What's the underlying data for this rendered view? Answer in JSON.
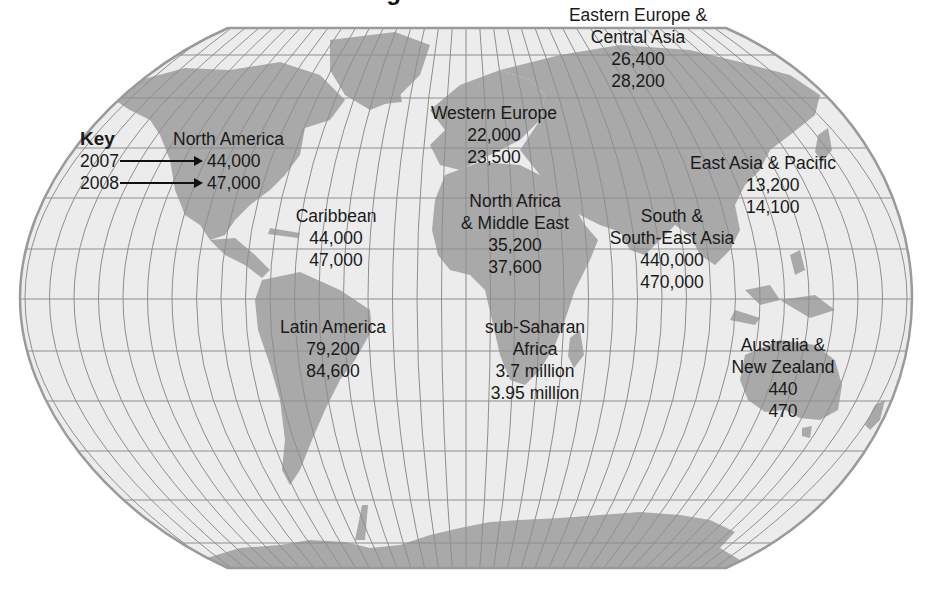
{
  "title": "Regional estimates",
  "colors": {
    "ocean": "#ececec",
    "land": "#a9a9a9",
    "grid": "#8e8e8e",
    "outline": "#9a9a9a",
    "text": "#1a1a1a"
  },
  "key": {
    "title": "Key",
    "year1": "2007",
    "year2": "2008"
  },
  "regions": [
    {
      "id": "north-america",
      "name": [
        "North America"
      ],
      "v2007": "44,000",
      "v2008": "47,000"
    },
    {
      "id": "caribbean",
      "name": [
        "Caribbean"
      ],
      "v2007": "44,000",
      "v2008": "47,000"
    },
    {
      "id": "latin-america",
      "name": [
        "Latin America"
      ],
      "v2007": "79,200",
      "v2008": "84,600"
    },
    {
      "id": "western-europe",
      "name": [
        "Western Europe"
      ],
      "v2007": "22,000",
      "v2008": "23,500"
    },
    {
      "id": "eastern-europe-central-asia",
      "name": [
        "Eastern Europe &",
        "Central Asia"
      ],
      "v2007": "26,400",
      "v2008": "28,200"
    },
    {
      "id": "north-africa-middle-east",
      "name": [
        "North Africa",
        "& Middle East"
      ],
      "v2007": "35,200",
      "v2008": "37,600"
    },
    {
      "id": "sub-saharan-africa",
      "name": [
        "sub-Saharan",
        "Africa"
      ],
      "v2007": "3.7 million",
      "v2008": "3.95 million"
    },
    {
      "id": "south-southeast-asia",
      "name": [
        "South &",
        "South-East Asia"
      ],
      "v2007": "440,000",
      "v2008": "470,000"
    },
    {
      "id": "east-asia-pacific",
      "name": [
        "East Asia & Pacific"
      ],
      "v2007": "13,200",
      "v2008": "14,100"
    },
    {
      "id": "australia-new-zealand",
      "name": [
        "Australia &",
        "New Zealand"
      ],
      "v2007": "440",
      "v2008": "470"
    }
  ],
  "chart_data": {
    "type": "table",
    "title": "Regional estimates",
    "columns": [
      "Region",
      "2007",
      "2008"
    ],
    "rows": [
      [
        "North America",
        44000,
        47000
      ],
      [
        "Caribbean",
        44000,
        47000
      ],
      [
        "Latin America",
        79200,
        84600
      ],
      [
        "Western Europe",
        22000,
        23500
      ],
      [
        "Eastern Europe & Central Asia",
        26400,
        28200
      ],
      [
        "North Africa & Middle East",
        35200,
        37600
      ],
      [
        "sub-Saharan Africa",
        3700000,
        3950000
      ],
      [
        "South & South-East Asia",
        440000,
        470000
      ],
      [
        "East Asia & Pacific",
        13200,
        14100
      ],
      [
        "Australia & New Zealand",
        440,
        470
      ]
    ]
  }
}
